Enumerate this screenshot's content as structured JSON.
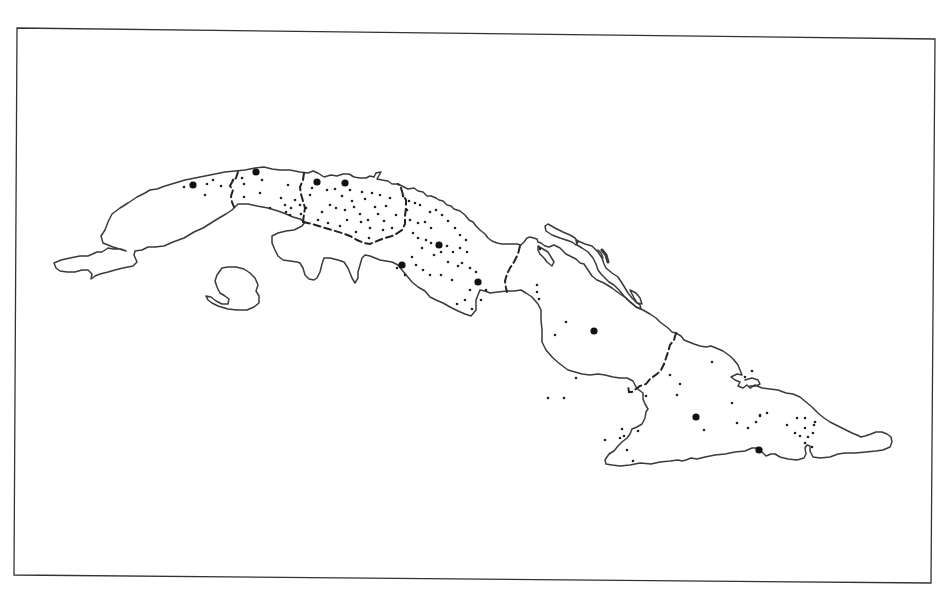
{
  "map": {
    "subject": "Cuba with provincial boundaries",
    "colors": {
      "background": "#ffffff",
      "outline": "#3a3a3a",
      "dots": "#111111"
    },
    "legend": [
      {
        "symbol": "large-dot",
        "meaning": "major city"
      },
      {
        "symbol": "small-dot",
        "meaning": "locality"
      },
      {
        "symbol": "dashed-line",
        "meaning": "provincial boundary"
      }
    ],
    "major_cities": [
      {
        "x": 193,
        "y": 185
      },
      {
        "x": 256,
        "y": 172
      },
      {
        "x": 317,
        "y": 182
      },
      {
        "x": 345,
        "y": 183
      },
      {
        "x": 439,
        "y": 245
      },
      {
        "x": 402,
        "y": 265
      },
      {
        "x": 478,
        "y": 282
      },
      {
        "x": 594,
        "y": 331
      },
      {
        "x": 696,
        "y": 417
      },
      {
        "x": 759,
        "y": 450
      }
    ],
    "localities": [
      [
        184,
        187
      ],
      [
        207,
        184
      ],
      [
        213,
        180
      ],
      [
        221,
        186
      ],
      [
        205,
        195
      ],
      [
        233,
        180
      ],
      [
        242,
        178
      ],
      [
        244,
        184
      ],
      [
        262,
        180
      ],
      [
        260,
        193
      ],
      [
        244,
        197
      ],
      [
        270,
        208
      ],
      [
        281,
        198
      ],
      [
        285,
        205
      ],
      [
        288,
        185
      ],
      [
        286,
        212
      ],
      [
        291,
        208
      ],
      [
        295,
        200
      ],
      [
        300,
        205
      ],
      [
        306,
        208
      ],
      [
        290,
        215
      ],
      [
        301,
        214
      ],
      [
        327,
        190
      ],
      [
        335,
        189
      ],
      [
        342,
        196
      ],
      [
        350,
        190
      ],
      [
        352,
        201
      ],
      [
        362,
        192
      ],
      [
        365,
        199
      ],
      [
        330,
        205
      ],
      [
        336,
        208
      ],
      [
        345,
        210
      ],
      [
        354,
        207
      ],
      [
        360,
        214
      ],
      [
        347,
        220
      ],
      [
        361,
        222
      ],
      [
        368,
        220
      ],
      [
        375,
        207
      ],
      [
        378,
        214
      ],
      [
        386,
        206
      ],
      [
        384,
        221
      ],
      [
        370,
        228
      ],
      [
        383,
        230
      ],
      [
        392,
        228
      ],
      [
        396,
        215
      ],
      [
        318,
        220
      ],
      [
        322,
        212
      ],
      [
        310,
        195
      ],
      [
        312,
        188
      ],
      [
        372,
        193
      ],
      [
        380,
        195
      ],
      [
        390,
        198
      ],
      [
        328,
        223
      ],
      [
        340,
        226
      ],
      [
        356,
        232
      ],
      [
        369,
        238
      ],
      [
        403,
        196
      ],
      [
        409,
        201
      ],
      [
        415,
        203
      ],
      [
        420,
        205
      ],
      [
        430,
        212
      ],
      [
        436,
        210
      ],
      [
        442,
        215
      ],
      [
        407,
        210
      ],
      [
        410,
        220
      ],
      [
        418,
        223
      ],
      [
        425,
        222
      ],
      [
        431,
        228
      ],
      [
        448,
        221
      ],
      [
        455,
        228
      ],
      [
        460,
        235
      ],
      [
        466,
        240
      ],
      [
        413,
        233
      ],
      [
        418,
        238
      ],
      [
        426,
        240
      ],
      [
        431,
        243
      ],
      [
        447,
        246
      ],
      [
        441,
        252
      ],
      [
        453,
        252
      ],
      [
        460,
        248
      ],
      [
        467,
        252
      ],
      [
        422,
        248
      ],
      [
        434,
        255
      ],
      [
        448,
        262
      ],
      [
        462,
        263
      ],
      [
        470,
        268
      ],
      [
        476,
        272
      ],
      [
        412,
        257
      ],
      [
        416,
        265
      ],
      [
        423,
        270
      ],
      [
        430,
        275
      ],
      [
        441,
        275
      ],
      [
        452,
        280
      ],
      [
        458,
        266
      ],
      [
        470,
        290
      ],
      [
        465,
        300
      ],
      [
        472,
        309
      ],
      [
        486,
        290
      ],
      [
        457,
        304
      ],
      [
        481,
        300
      ],
      [
        405,
        275
      ],
      [
        397,
        268
      ],
      [
        540,
        249
      ],
      [
        537,
        285
      ],
      [
        537,
        292
      ],
      [
        539,
        299
      ],
      [
        555,
        335
      ],
      [
        566,
        322
      ],
      [
        548,
        398
      ],
      [
        564,
        398
      ],
      [
        576,
        378
      ],
      [
        630,
        392
      ],
      [
        670,
        375
      ],
      [
        680,
        384
      ],
      [
        677,
        395
      ],
      [
        712,
        362
      ],
      [
        732,
        403
      ],
      [
        745,
        377
      ],
      [
        752,
        371
      ],
      [
        760,
        415
      ],
      [
        737,
        423
      ],
      [
        760,
        416
      ],
      [
        646,
        396
      ],
      [
        704,
        430
      ],
      [
        748,
        428
      ],
      [
        756,
        422
      ],
      [
        767,
        413
      ],
      [
        787,
        425
      ],
      [
        795,
        433
      ],
      [
        800,
        436
      ],
      [
        805,
        428
      ],
      [
        814,
        425
      ],
      [
        813,
        433
      ],
      [
        808,
        437
      ],
      [
        805,
        443
      ],
      [
        812,
        447
      ],
      [
        797,
        418
      ],
      [
        805,
        418
      ],
      [
        815,
        422
      ],
      [
        622,
        429
      ],
      [
        620,
        438
      ],
      [
        638,
        431
      ],
      [
        624,
        436
      ],
      [
        633,
        461
      ],
      [
        605,
        440
      ],
      [
        627,
        450
      ]
    ]
  }
}
